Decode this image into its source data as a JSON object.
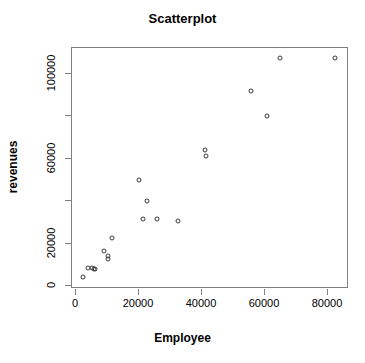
{
  "chart_data": {
    "type": "scatter",
    "title": "Scatterplot",
    "xlabel": "Employee",
    "ylabel": "revenues",
    "xlim": [
      0,
      93000
    ],
    "ylim": [
      0,
      115000
    ],
    "grid": false,
    "legend": null,
    "marker": "open-circle",
    "xticks": [
      {
        "value": 0,
        "label": "0"
      },
      {
        "value": 20000,
        "label": "20000"
      },
      {
        "value": 40000,
        "label": "40000"
      },
      {
        "value": 60000,
        "label": "60000"
      },
      {
        "value": 80000,
        "label": "80000"
      }
    ],
    "yticks": [
      {
        "value": 0,
        "label": "0"
      },
      {
        "value": 20000,
        "label": "20000"
      },
      {
        "value": 40000,
        "label": ""
      },
      {
        "value": 60000,
        "label": "60000"
      },
      {
        "value": 80000,
        "label": ""
      },
      {
        "value": 100000,
        "label": "100000"
      },
      {
        "value": 120000,
        "label": ""
      }
    ],
    "x": [
      2500,
      4100,
      5400,
      6000,
      6300,
      9200,
      10400,
      10500,
      11700,
      20200,
      21500,
      23000,
      26000,
      32800,
      41300,
      41500,
      56000,
      61000,
      65000,
      82500
    ],
    "y": [
      3800,
      8000,
      8000,
      7500,
      7500,
      16000,
      13700,
      12300,
      22000,
      49500,
      31000,
      39500,
      31000,
      30000,
      63500,
      61000,
      91500,
      79500,
      107000,
      107000
    ],
    "points": [
      {
        "x": 2500,
        "y": 3800
      },
      {
        "x": 4100,
        "y": 8000
      },
      {
        "x": 5400,
        "y": 8000
      },
      {
        "x": 6000,
        "y": 7500
      },
      {
        "x": 6300,
        "y": 7500
      },
      {
        "x": 9200,
        "y": 16000
      },
      {
        "x": 10400,
        "y": 13700
      },
      {
        "x": 10500,
        "y": 12300
      },
      {
        "x": 11700,
        "y": 22000
      },
      {
        "x": 20200,
        "y": 49500
      },
      {
        "x": 21500,
        "y": 31000
      },
      {
        "x": 23000,
        "y": 39500
      },
      {
        "x": 26000,
        "y": 31000
      },
      {
        "x": 32800,
        "y": 30000
      },
      {
        "x": 41300,
        "y": 63500
      },
      {
        "x": 41500,
        "y": 61000
      },
      {
        "x": 56000,
        "y": 91500
      },
      {
        "x": 61000,
        "y": 79500
      },
      {
        "x": 65000,
        "y": 107000
      },
      {
        "x": 82500,
        "y": 107000
      }
    ],
    "colors": {
      "point_stroke": "#3a3a3a",
      "axis": "#808080",
      "text": "#000000",
      "background": "#ffffff"
    }
  }
}
